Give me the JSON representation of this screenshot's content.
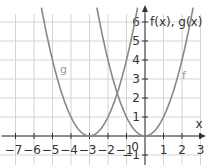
{
  "chart_data": {
    "type": "line",
    "title": "",
    "xlabel": "x",
    "ylabel": "f(x), g(x)",
    "xlim": [
      -7.7,
      3.4
    ],
    "ylim": [
      -1.6,
      6.8
    ],
    "grid": true,
    "x_ticks": [
      "−7",
      "−6",
      "−5",
      "−4",
      "−3",
      "−2",
      "−1",
      "1",
      "2",
      "3"
    ],
    "y_ticks": [
      "6",
      "5",
      "4",
      "3",
      "2",
      "1",
      "−1"
    ],
    "origin_label": "0",
    "series": [
      {
        "name": "f",
        "formula": "x^2",
        "vertex": [
          0,
          0
        ],
        "label": "f"
      },
      {
        "name": "g",
        "formula": "(x+3)^2",
        "vertex": [
          -3,
          0
        ],
        "label": "g"
      }
    ],
    "annotations": [
      {
        "text": "g",
        "x": -4.4,
        "y": 3.3
      },
      {
        "text": "f",
        "x": 2.1,
        "y": 3.0
      }
    ]
  }
}
